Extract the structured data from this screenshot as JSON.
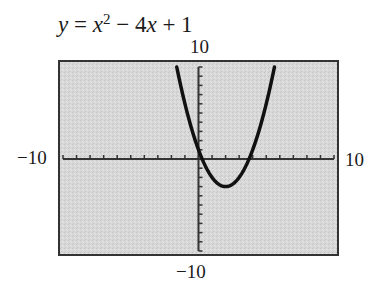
{
  "title": {
    "y": "y",
    "eq": " = ",
    "x1": "x",
    "exp": "2",
    "rest1": " − 4",
    "x2": "x",
    "rest2": " + 1"
  },
  "window": {
    "ymax_label": "10",
    "ymin_label": "−10",
    "xmin_label": "−10",
    "xmax_label": "10"
  },
  "colors": {
    "screen_bg": "#d6d6d6",
    "frame": "#333333",
    "curve": "#111111",
    "axis": "#333333"
  },
  "chart_data": {
    "type": "line",
    "xlabel": "",
    "ylabel": "",
    "xlim": [
      -10,
      10
    ],
    "ylim": [
      -10,
      10
    ],
    "x_tick_step": 1,
    "y_tick_step": 1,
    "grid": false,
    "function": "x^2 - 4x + 1",
    "series": [
      {
        "name": "y = x^2 - 4x + 1",
        "x": [
          -1.6,
          -1,
          0,
          1,
          2,
          3,
          4,
          5,
          5.6
        ],
        "y": [
          10.0,
          6,
          1,
          -2,
          -3,
          -2,
          1,
          6,
          10.0
        ]
      }
    ],
    "key_points": {
      "vertex": [
        2,
        -3
      ],
      "y_intercept": [
        0,
        1
      ],
      "x_intercepts": [
        0.27,
        3.73
      ]
    }
  }
}
